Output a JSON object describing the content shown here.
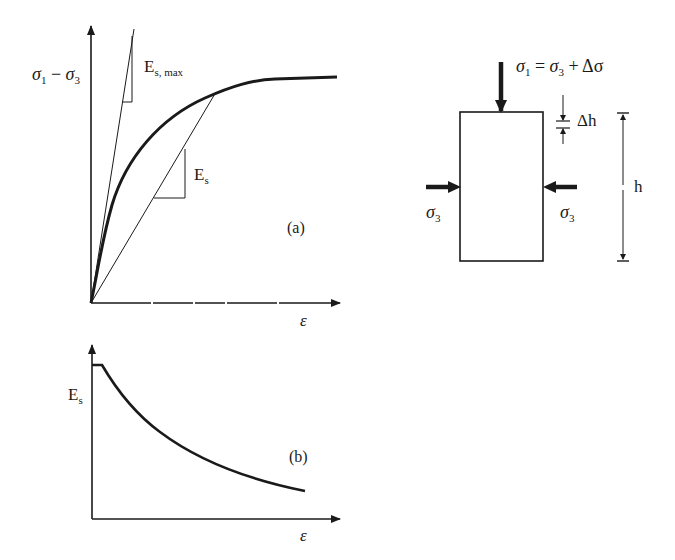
{
  "panel_a": {
    "y_axis_label_sigma1": "σ",
    "y_axis_label_sub1": "1",
    "y_axis_label_minus": " − ",
    "y_axis_label_sigma3": "σ",
    "y_axis_label_sub3": "3",
    "x_axis_label": "ε",
    "es_max_label_main": "E",
    "es_max_label_sub": "s, max",
    "es_label_main": "E",
    "es_label_sub": "s",
    "panel_tag": "(a)"
  },
  "panel_b": {
    "y_axis_label_main": "E",
    "y_axis_label_sub": "s",
    "x_axis_label": "ε",
    "panel_tag": "(b)"
  },
  "specimen": {
    "top_load_sigma1": "σ",
    "top_load_sub1": "1",
    "top_load_eq": " = ",
    "top_load_sigma3": "σ",
    "top_load_sub3": "3",
    "top_load_plus": " + Δσ",
    "left_confining_sigma": "σ",
    "left_confining_sub": "3",
    "right_confining_sigma": "σ",
    "right_confining_sub": "3",
    "delta_h_label": "Δh",
    "height_label": "h"
  },
  "colors": {
    "ink": "#1a1a1a",
    "background": "#ffffff"
  }
}
